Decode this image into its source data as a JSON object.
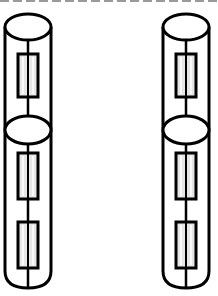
{
  "diagram": {
    "type": "cylindrical-resistor-columns",
    "background": "#ffffff",
    "stroke_color": "#000000",
    "resistor_fill": "#e6e6e6",
    "top_border": {
      "style": "dashed",
      "color": "#9a9a9a"
    },
    "columns": [
      {
        "id": "left-column",
        "center_x": 28,
        "half_width": 23,
        "upper_segment": {
          "top_ellipse_cy": 27,
          "resistors": [
            {
              "y": 54,
              "height": 43
            }
          ]
        },
        "lower_segment": {
          "top_ellipse_cy": 130,
          "bottom_y": 288,
          "resistors": [
            {
              "y": 153,
              "height": 46
            },
            {
              "y": 222,
              "height": 46
            }
          ]
        }
      },
      {
        "id": "right-column",
        "center_x": 186,
        "half_width": 23,
        "upper_segment": {
          "top_ellipse_cy": 27,
          "resistors": [
            {
              "y": 54,
              "height": 43
            }
          ]
        },
        "lower_segment": {
          "top_ellipse_cy": 130,
          "bottom_y": 288,
          "resistors": [
            {
              "y": 153,
              "height": 46
            },
            {
              "y": 222,
              "height": 46
            }
          ]
        }
      }
    ]
  }
}
